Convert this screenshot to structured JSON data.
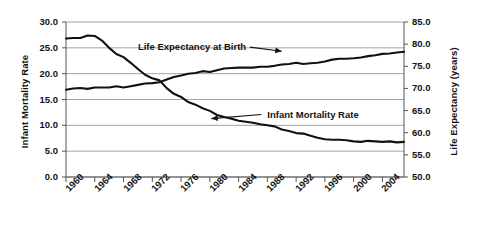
{
  "chart_data": {
    "type": "line",
    "title": "",
    "xlabel": "",
    "grid": "horizontal",
    "legend_position": "inline-annotations",
    "x": [
      1960,
      1961,
      1962,
      1963,
      1964,
      1965,
      1966,
      1967,
      1968,
      1969,
      1970,
      1971,
      1972,
      1973,
      1974,
      1975,
      1976,
      1977,
      1978,
      1979,
      1980,
      1981,
      1982,
      1983,
      1984,
      1985,
      1986,
      1987,
      1988,
      1989,
      1990,
      1991,
      1992,
      1993,
      1994,
      1995,
      1996,
      1997,
      1998,
      1999,
      2000,
      2001,
      2002,
      2003,
      2004,
      2005,
      2006,
      2007
    ],
    "xlim": [
      1960,
      2007
    ],
    "xticks": [
      "1960",
      "1964",
      "1968",
      "1972",
      "1976",
      "1980",
      "1984",
      "1988",
      "1992",
      "1996",
      "2000",
      "2004"
    ],
    "axes": [
      {
        "side": "left",
        "label": "Infant Mortality Rate",
        "ylim": [
          0.0,
          30.0
        ],
        "yticks": [
          "0.0",
          "5.0",
          "10.0",
          "15.0",
          "20.0",
          "25.0",
          "30.0"
        ]
      },
      {
        "side": "right",
        "label": "Life Expectancy (years)",
        "ylim": [
          50.0,
          85.0
        ],
        "yticks": [
          "50.0",
          "55.0",
          "60.0",
          "65.0",
          "70.0",
          "75.0",
          "80.0",
          "85.0"
        ]
      }
    ],
    "series": [
      {
        "name": "Infant Mortality Rate",
        "axis": "left",
        "color": "#111111",
        "annotation": {
          "text": "Infant Mortality Rate",
          "label_x": 1988.0,
          "label_y": 11.9,
          "arrow_to_x": 1980.2,
          "arrow_to_y": 11.3
        },
        "values": [
          26.8,
          26.9,
          26.9,
          27.4,
          27.3,
          26.4,
          25.0,
          23.8,
          23.2,
          22.1,
          20.9,
          19.8,
          19.1,
          18.7,
          17.2,
          16.1,
          15.5,
          14.5,
          14.0,
          13.3,
          12.8,
          12.0,
          11.6,
          11.3,
          10.9,
          10.7,
          10.5,
          10.2,
          10.0,
          9.8,
          9.2,
          8.9,
          8.5,
          8.4,
          8.0,
          7.6,
          7.3,
          7.2,
          7.2,
          7.1,
          6.9,
          6.8,
          7.0,
          6.9,
          6.8,
          6.9,
          6.7,
          6.8
        ]
      },
      {
        "name": "Life Expectancy at Birth",
        "axis": "right",
        "color": "#111111",
        "annotation": {
          "text": "Life Expectancy at Birth",
          "label_x": 1970.0,
          "label_y": 79.1,
          "arrow_to_x": 1990.0,
          "arrow_to_y": 78.4
        },
        "values": [
          69.7,
          70.0,
          70.1,
          69.9,
          70.2,
          70.2,
          70.2,
          70.5,
          70.2,
          70.5,
          70.8,
          71.1,
          71.2,
          71.4,
          72.0,
          72.6,
          72.9,
          73.3,
          73.5,
          73.9,
          73.7,
          74.1,
          74.5,
          74.6,
          74.7,
          74.7,
          74.7,
          74.9,
          74.9,
          75.1,
          75.4,
          75.5,
          75.8,
          75.5,
          75.7,
          75.8,
          76.1,
          76.5,
          76.7,
          76.7,
          76.8,
          77.0,
          77.3,
          77.5,
          77.8,
          77.9,
          78.1,
          78.3
        ]
      }
    ]
  }
}
